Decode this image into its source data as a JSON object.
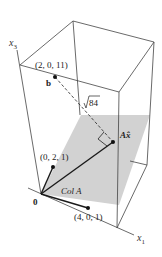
{
  "figure": {
    "axes": {
      "x1_label": "x",
      "x1_sub": "1",
      "x3_label": "x",
      "x3_sub": "3"
    },
    "points": {
      "b": {
        "label": "b",
        "coords": "(2, 0, 11)"
      },
      "ax_hat": {
        "label": "Ax̂"
      },
      "col1": {
        "coords": "(0, 2, 1)"
      },
      "col2": {
        "coords": "(4, 0, 1)"
      },
      "origin": {
        "label": "0"
      }
    },
    "distance_label_radicand": "84",
    "plane_label": "Col A",
    "colors": {
      "plane": "#d2d2d2",
      "lines": "#333333",
      "vectors": "#1a1a1a"
    }
  }
}
